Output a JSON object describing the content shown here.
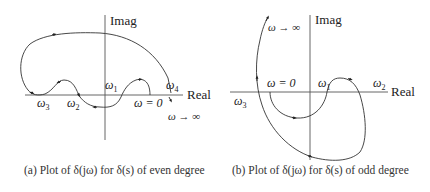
{
  "figure": {
    "panel_a": {
      "axis_labels": {
        "imag": "Imag",
        "real": "Real"
      },
      "point_labels": {
        "w0": "ω = 0",
        "w1": "ω",
        "w1_sub": "1",
        "w2": "ω",
        "w2_sub": "2",
        "w3": "ω",
        "w3_sub": "3",
        "w4": "ω",
        "w4_sub": "4",
        "winf": "ω → ∞"
      },
      "caption": "(a) Plot of δ(jω) for δ(s) of even degree"
    },
    "panel_b": {
      "axis_labels": {
        "imag": "Imag",
        "real": "Real"
      },
      "point_labels": {
        "w0": "ω = 0",
        "w1": "ω",
        "w1_sub": "1",
        "w2": "ω",
        "w2_sub": "2",
        "w3": "ω",
        "w3_sub": "3",
        "winf": "ω → ∞"
      },
      "caption": "(b) Plot of δ(jω) for δ(s) of odd degree"
    }
  }
}
